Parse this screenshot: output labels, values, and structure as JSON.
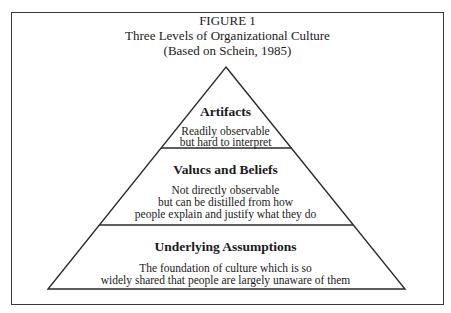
{
  "figure": {
    "number_label": "FIGURE 1",
    "title": "Three Levels of Organizational Culture",
    "subtitle": "(Based on Schein, 1985)"
  },
  "pyramid": {
    "levels": [
      {
        "title": "Artifacts",
        "description": [
          "Readily observable",
          "but hard to interpret"
        ]
      },
      {
        "title": "Valucs and Beliefs",
        "description": [
          "Not directly observable",
          "but can be distilled from how",
          "people explain and justify what they do"
        ]
      },
      {
        "title": "Underlying Assumptions",
        "description": [
          "The foundation of culture which is so",
          "widely shared that people are largely unaware of them"
        ]
      }
    ]
  },
  "colors": {
    "line": "#2a2a2a",
    "text": "#1a1a1a",
    "background": "#ffffff"
  }
}
